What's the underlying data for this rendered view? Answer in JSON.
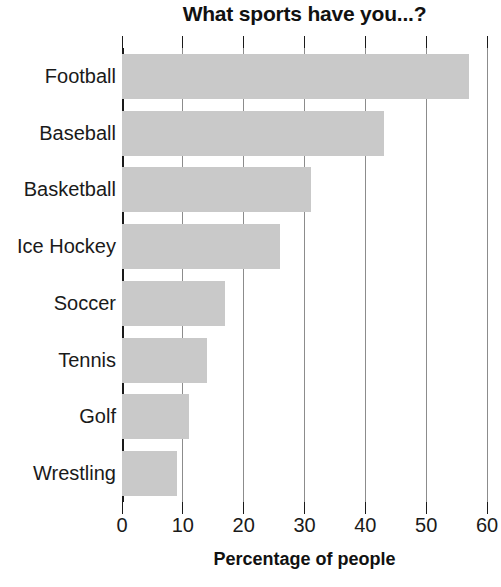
{
  "chart_data": {
    "type": "bar",
    "orientation": "horizontal",
    "title": "What sports have you...?",
    "xlabel": "Percentage of people",
    "ylabel": "",
    "categories": [
      "Football",
      "Baseball",
      "Basketball",
      "Ice Hockey",
      "Soccer",
      "Tennis",
      "Golf",
      "Wrestling"
    ],
    "values": [
      57,
      43,
      31,
      26,
      17,
      14,
      11,
      9
    ],
    "xlim": [
      0,
      60
    ],
    "xticks": [
      0,
      10,
      20,
      30,
      40,
      50,
      60
    ],
    "xtick_labels": [
      "0",
      "10",
      "20",
      "30",
      "40",
      "50",
      "60"
    ],
    "grid": true,
    "legend": false,
    "bar_color": "#c9c9c9",
    "axis_color": "#1a1a1a",
    "gridline_color": "#8c8c8c"
  }
}
